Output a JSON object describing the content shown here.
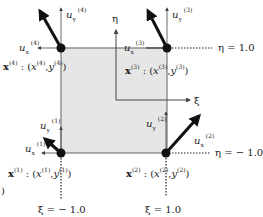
{
  "diagram": {
    "type": "isoparametric-quadrilateral-element",
    "colors": {
      "element_fill": "#e6e6e6",
      "element_edge": "#7a7a7a",
      "node": "#111111",
      "arrow": "#111111",
      "axis": "#444444",
      "text": "#222222"
    },
    "axes": {
      "xi_label": "ξ",
      "eta_label": "η"
    },
    "boundaries": {
      "eta_top": "η = 1.0",
      "eta_bottom": "η = − 1.0",
      "xi_left": "ξ = − 1.0",
      "xi_right": "ξ = 1.0"
    },
    "nodes": [
      {
        "id": "1",
        "coord_prefix": "x",
        "coord_sup": "(1)",
        "coord_x": "x",
        "coord_y": "y",
        "ux": "u",
        "ux_sub": "x",
        "uy": "u",
        "uy_sub": "y",
        "sup": "(1)"
      },
      {
        "id": "2",
        "coord_prefix": "x",
        "coord_sup": "(2)",
        "coord_x": "x",
        "coord_y": "y",
        "ux": "u",
        "ux_sub": "x",
        "uy": "u",
        "uy_sub": "y",
        "sup": "(2)"
      },
      {
        "id": "3",
        "coord_prefix": "x",
        "coord_sup": "(3)",
        "coord_x": "x",
        "coord_y": "y",
        "ux": "u",
        "ux_sub": "x",
        "uy": "u",
        "uy_sub": "y",
        "sup": "(3)"
      },
      {
        "id": "4",
        "coord_prefix": "x",
        "coord_sup": "(4)",
        "coord_x": "x",
        "coord_y": "y",
        "ux": "u",
        "ux_sub": "x",
        "uy": "u",
        "uy_sub": "y",
        "sup": "(4)"
      }
    ],
    "stray_fragment": ")"
  }
}
